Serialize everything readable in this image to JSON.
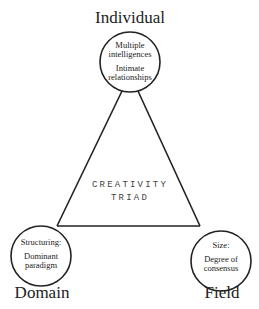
{
  "center": {
    "line1": "CREATIVITY",
    "line2": "TRIAD"
  },
  "nodes": {
    "individual": {
      "label": "Individual",
      "line1": "Multiple",
      "line2": "intelligences",
      "line3": "Intimate",
      "line4": "relationships"
    },
    "domain": {
      "label": "Domain",
      "line1": "Structuring:",
      "line2": "Dominant",
      "line3": "paradigm"
    },
    "field": {
      "label": "Field",
      "line1": "Size:",
      "line2": "Degree of",
      "line3": "consensus"
    }
  },
  "colors": {
    "stroke": "#222222",
    "text": "#222222",
    "center_text": "#444444"
  }
}
